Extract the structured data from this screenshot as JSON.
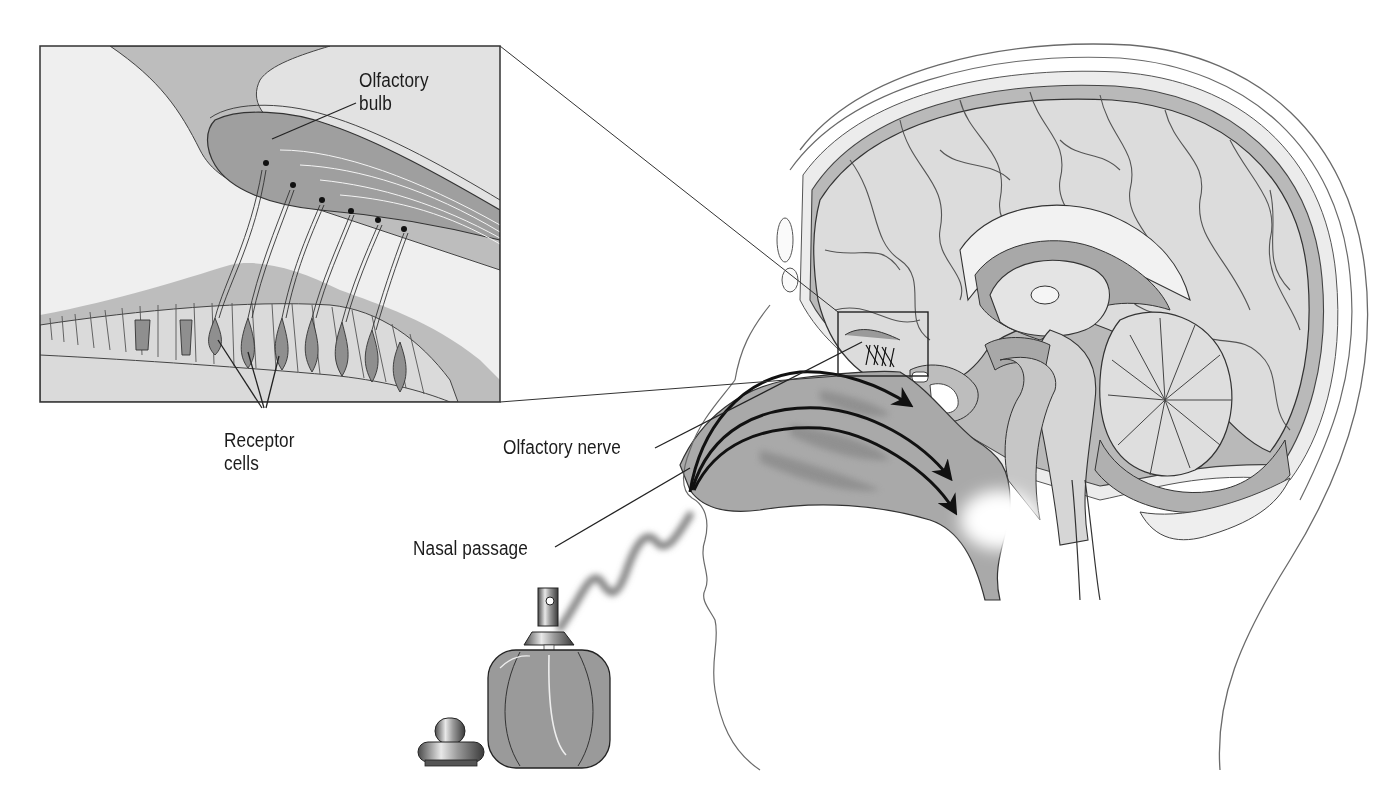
{
  "diagram": {
    "colors": {
      "background": "#ffffff",
      "tissue_light": "#e6e6e6",
      "tissue_mid": "#bdbdbd",
      "tissue_dark": "#9d9d9d",
      "outline": "#2a2a2a",
      "label_text": "#1c1c1c"
    },
    "labels": {
      "olfactory_bulb": {
        "line1": "Olfactory",
        "line2": "bulb"
      },
      "receptor_cells": {
        "line1": "Receptor",
        "line2": "cells"
      },
      "olfactory_nerve": {
        "text": "Olfactory nerve"
      },
      "nasal_passage": {
        "text": "Nasal passage"
      }
    },
    "parts": [
      "inset-magnified-view",
      "brain-sagittal-section",
      "head-outline",
      "airflow-arrows",
      "scent-wave",
      "perfume-bottle",
      "bottle-cap"
    ],
    "airflow_arrow_count": 3,
    "receptor_cell_pointer_count": 3
  }
}
